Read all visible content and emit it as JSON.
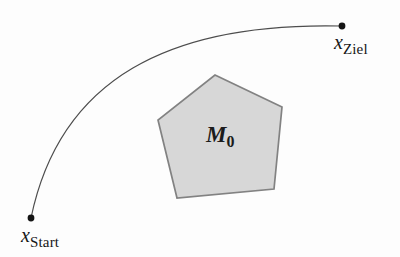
{
  "figure": {
    "background": "#fdfdfd",
    "curve": {
      "path": "M 31 218 C 60 78, 170 22, 342 26",
      "color": "#4d4d4d",
      "width": "1.2"
    },
    "points": {
      "start": {
        "x": "31",
        "y": "218",
        "label_main": "x",
        "label_sub": "Start"
      },
      "goal": {
        "x": "342",
        "y": "26",
        "label_main": "x",
        "label_sub": "Ziel"
      },
      "dot_color": "#141414",
      "dot_radius": "3.4"
    },
    "obstacle": {
      "points": "215,75 282,107 274,189 177,198 158,120",
      "fill": "#d7d7d7",
      "stroke": "#828282",
      "stroke_width": "1.7",
      "label_main": "M",
      "label_sub": "0"
    }
  }
}
